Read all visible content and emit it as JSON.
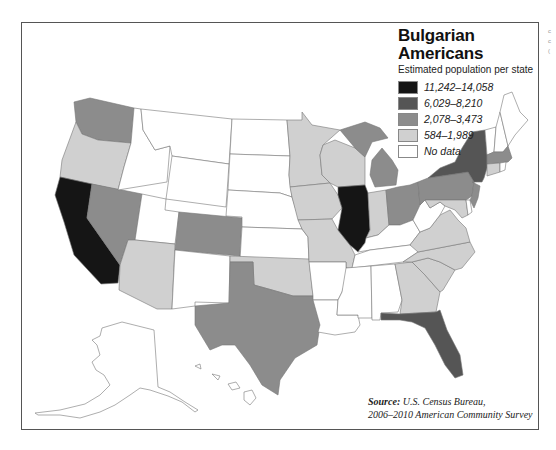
{
  "map": {
    "title": "Bulgarian Americans",
    "subtitle": "Estimated population per state",
    "legend": [
      {
        "label": "11,242–14,058",
        "category": "c1",
        "color": "#151515"
      },
      {
        "label": "6,029–8,210",
        "category": "c2",
        "color": "#555555"
      },
      {
        "label": "2,078–3,473",
        "category": "c3",
        "color": "#8c8c8c"
      },
      {
        "label": "584–1,989",
        "category": "c4",
        "color": "#d0d0d0"
      },
      {
        "label": "No data",
        "category": "nd",
        "color": "#ffffff"
      }
    ],
    "source_label": "Source:",
    "source_text": "U.S. Census Bureau,",
    "source_line2": "2006–2010 American Community Survey",
    "states": {
      "California": "c1",
      "Illinois": "c1",
      "New York": "c2",
      "Florida": "c2",
      "Washington": "c3",
      "Nevada": "c3",
      "Colorado": "c3",
      "Texas": "c3",
      "Michigan": "c3",
      "Ohio": "c3",
      "Pennsylvania": "c3",
      "New Jersey": "c3",
      "Massachusetts": "c3",
      "Oregon": "c4",
      "Arizona": "c4",
      "Minnesota": "c4",
      "Wisconsin": "c4",
      "Iowa": "c4",
      "Missouri": "c4",
      "Indiana": "c4",
      "Oklahoma": "c4",
      "Virginia": "c4",
      "North Carolina": "c4",
      "South Carolina": "c4",
      "Georgia": "c4",
      "Maryland": "c4",
      "Connecticut": "c4",
      "Idaho": "nd",
      "Montana": "nd",
      "Wyoming": "nd",
      "Utah": "nd",
      "New Mexico": "nd",
      "North Dakota": "nd",
      "South Dakota": "nd",
      "Nebraska": "nd",
      "Kansas": "nd",
      "Arkansas": "nd",
      "Louisiana": "nd",
      "Mississippi": "nd",
      "Alabama": "nd",
      "Tennessee": "nd",
      "Kentucky": "nd",
      "West Virginia": "nd",
      "Vermont": "nd",
      "New Hampshire": "nd",
      "Maine": "nd",
      "Rhode Island": "nd",
      "Delaware": "nd",
      "Alaska": "nd",
      "Hawaii": "nd"
    }
  },
  "edge_fragments": [
    "c",
    "c",
    "("
  ]
}
